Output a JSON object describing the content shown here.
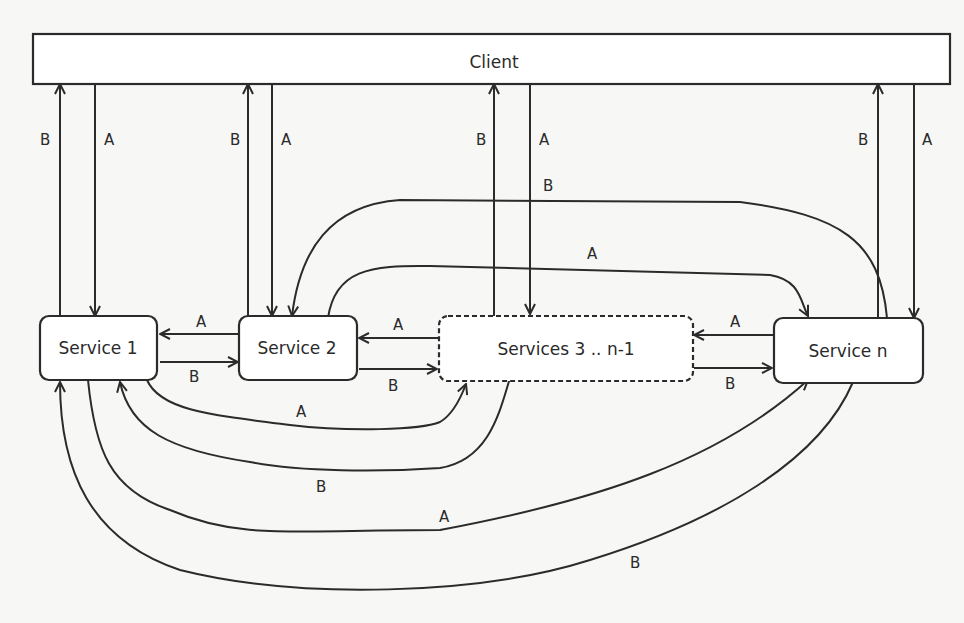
{
  "diagram": {
    "nodes": {
      "client": "Client",
      "service1": "Service 1",
      "service2": "Service 2",
      "services3": "Services 3 .. n-1",
      "serviceN": "Service n"
    },
    "labels": {
      "a": "A",
      "b": "B"
    },
    "colors": {
      "stroke": "#2b2b2b",
      "background": "#f7f7f5",
      "box_fill": "#ffffff"
    }
  }
}
